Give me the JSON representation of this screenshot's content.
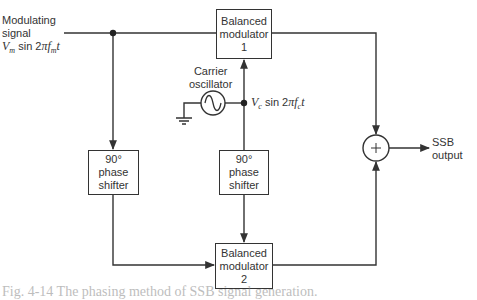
{
  "diagram": {
    "inputs": {
      "modulating_signal": {
        "label_line1": "Modulating",
        "label_line2": "signal",
        "expr_amp": "V",
        "expr_amp_sub": "m",
        "expr_mid": " sin 2",
        "expr_pi": "π",
        "expr_f": "f",
        "expr_f_sub": "m",
        "expr_t": "t"
      },
      "carrier": {
        "label_line1": "Carrier",
        "label_line2": "oscillator",
        "expr_amp": "V",
        "expr_amp_sub": "c",
        "expr_mid": " sin 2",
        "expr_pi": "π",
        "expr_f": "f",
        "expr_f_sub": "c",
        "expr_t": "t"
      }
    },
    "blocks": {
      "modulator1": {
        "line1": "Balanced",
        "line2": "modulator",
        "line3": "1"
      },
      "modulator2": {
        "line1": "Balanced",
        "line2": "modulator",
        "line3": "2"
      },
      "shifter_left": {
        "line1": "90°",
        "line2": "phase",
        "line3": "shifter"
      },
      "shifter_right": {
        "line1": "90°",
        "line2": "phase",
        "line3": "shifter"
      },
      "summer": {
        "symbol": "+"
      }
    },
    "output": {
      "line1": "SSB",
      "line2": "output"
    },
    "caption": "Fig. 4-14   The phasing method of SSB signal generation."
  },
  "colors": {
    "line": "#333333",
    "background": "#ffffff"
  }
}
